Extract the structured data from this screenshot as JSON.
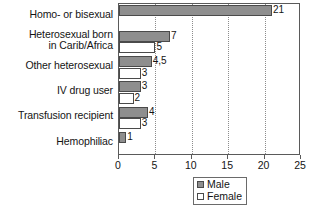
{
  "chart_data": {
    "type": "bar",
    "orientation": "horizontal",
    "title": "",
    "xlabel": "",
    "ylabel": "",
    "xlim": [
      0,
      25
    ],
    "xticks": [
      "0",
      "5",
      "10",
      "15",
      "20",
      "25"
    ],
    "grid": "vertical-dotted",
    "legend_position": "bottom-center",
    "categories": [
      "Homo- or bisexual",
      "Heterosexual born\nin Carib/Africa",
      "Other heterosexual",
      "IV drug user",
      "Transfusion recipient",
      "Hemophiliac"
    ],
    "series": [
      {
        "name": "Male",
        "color": "#8e8e8e",
        "values": [
          21,
          7,
          4.5,
          3,
          4,
          1
        ],
        "labels": [
          "21",
          "7",
          "4,5",
          "3",
          "4",
          "1"
        ]
      },
      {
        "name": "Female",
        "color": "#ffffff",
        "values": [
          0,
          5,
          3,
          2,
          3,
          0
        ],
        "labels": [
          "",
          "5",
          "3",
          "2",
          "3",
          ""
        ]
      }
    ]
  },
  "legend": {
    "entries": [
      {
        "label": "Male",
        "swatch": "male"
      },
      {
        "label": "Female",
        "swatch": "female"
      }
    ]
  },
  "axis": {
    "ticks": [
      {
        "value": 0,
        "label": "0"
      },
      {
        "value": 5,
        "label": "5"
      },
      {
        "value": 10,
        "label": "10"
      },
      {
        "value": 15,
        "label": "15"
      },
      {
        "value": 20,
        "label": "20"
      },
      {
        "value": 25,
        "label": "25"
      }
    ]
  }
}
